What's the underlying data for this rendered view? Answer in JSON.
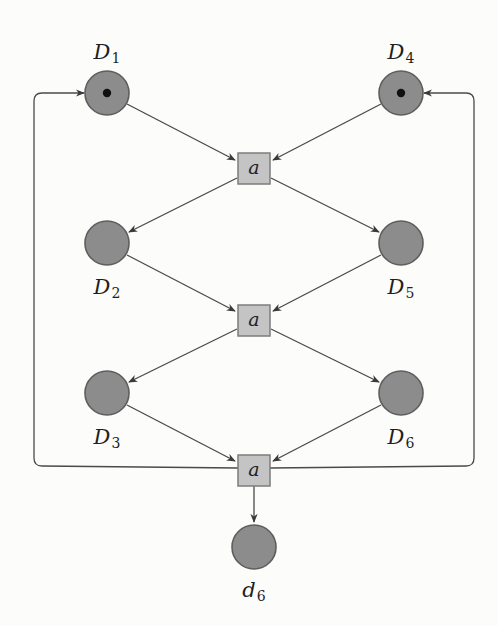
{
  "diagram": {
    "type": "petri-net",
    "colors": {
      "place_fill": "#8c8c8c",
      "place_stroke": "#5e5e5e",
      "transition_fill": "#c4c4c4",
      "transition_stroke": "#7c7c7c",
      "arc": "#4a4a4a",
      "token": "#111111"
    },
    "places": [
      {
        "id": "D1",
        "label": "D",
        "sub": "1",
        "tokens": 1
      },
      {
        "id": "D4",
        "label": "D",
        "sub": "4",
        "tokens": 1
      },
      {
        "id": "D2",
        "label": "D",
        "sub": "2",
        "tokens": 0
      },
      {
        "id": "D5",
        "label": "D",
        "sub": "5",
        "tokens": 0
      },
      {
        "id": "D3",
        "label": "D",
        "sub": "3",
        "tokens": 0
      },
      {
        "id": "D6",
        "label": "D",
        "sub": "6",
        "tokens": 0
      },
      {
        "id": "d6",
        "label": "d",
        "sub": "6",
        "tokens": 0
      }
    ],
    "transitions": [
      {
        "id": "t1",
        "label": "a"
      },
      {
        "id": "t2",
        "label": "a"
      },
      {
        "id": "t3",
        "label": "a"
      }
    ],
    "arcs": [
      {
        "from": "D1",
        "to": "t1"
      },
      {
        "from": "D4",
        "to": "t1"
      },
      {
        "from": "t1",
        "to": "D2"
      },
      {
        "from": "t1",
        "to": "D5"
      },
      {
        "from": "D2",
        "to": "t2"
      },
      {
        "from": "D5",
        "to": "t2"
      },
      {
        "from": "t2",
        "to": "D3"
      },
      {
        "from": "t2",
        "to": "D6"
      },
      {
        "from": "D3",
        "to": "t3"
      },
      {
        "from": "D6",
        "to": "t3"
      },
      {
        "from": "t3",
        "to": "d6"
      },
      {
        "from": "t3",
        "to": "D1",
        "route": "left-loop"
      },
      {
        "from": "t3",
        "to": "D4",
        "route": "right-loop"
      }
    ]
  }
}
